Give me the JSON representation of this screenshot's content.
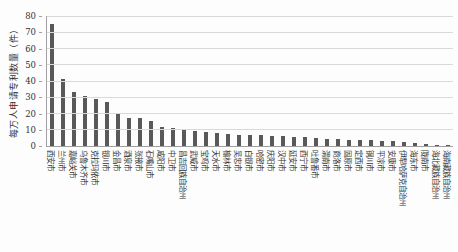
{
  "chart_data": {
    "type": "bar",
    "title": "",
    "xlabel": "",
    "ylabel": "每万人申请专利数量（件）",
    "ylim": [
      0,
      80
    ],
    "yticks": [
      0,
      10,
      20,
      30,
      40,
      50,
      60,
      70,
      80
    ],
    "grid": "horizontal",
    "legend": "none",
    "bar_color": "#595959",
    "categories": [
      "西安市",
      "兰州市",
      "嘉峪关市",
      "乌鲁木齐市",
      "克拉玛依市",
      "银川市",
      "金昌市",
      "酒泉市",
      "张掖市",
      "石嘴山市",
      "咸阳市",
      "中卫市",
      "昌吉回族自治州",
      "武威市",
      "宝鸡市",
      "天水市",
      "榆林市",
      "吴忠市",
      "白银市",
      "哈密市",
      "庆阳市",
      "汉中市",
      "延安市",
      "西宁市",
      "吐鲁番市",
      "渭南市",
      "商洛市",
      "固原市",
      "定西市",
      "铜川市",
      "平凉市",
      "安康市",
      "伊犁哈萨克自治州",
      "海东市",
      "陇南市",
      "海北藏族自治州",
      "海南藏族自治州"
    ],
    "values": [
      75,
      41,
      33,
      31,
      29,
      27,
      20.5,
      17.5,
      17,
      15.5,
      12,
      11,
      10.5,
      9,
      8.5,
      8,
      7.5,
      7,
      7,
      6.5,
      6,
      6,
      5.5,
      5.5,
      5,
      4.5,
      4.5,
      4,
      3.5,
      3.5,
      3,
      3,
      2.5,
      2,
      1.5,
      0.7,
      0.5
    ]
  }
}
